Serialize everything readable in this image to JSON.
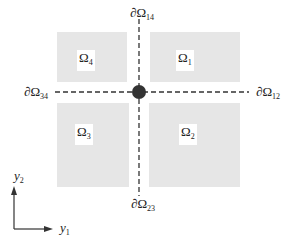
{
  "diagram": {
    "regions": [
      {
        "id": "omega4",
        "symbol": "Ω",
        "sub": "4"
      },
      {
        "id": "omega1",
        "symbol": "Ω",
        "sub": "1"
      },
      {
        "id": "omega3",
        "symbol": "Ω",
        "sub": "3"
      },
      {
        "id": "omega2",
        "symbol": "Ω",
        "sub": "2"
      }
    ],
    "boundaries": {
      "top": {
        "symbol": "∂Ω",
        "sub": "14"
      },
      "left": {
        "symbol": "∂Ω",
        "sub": "34"
      },
      "right": {
        "symbol": "∂Ω",
        "sub": "12"
      },
      "bottom": {
        "symbol": "∂Ω",
        "sub": "23"
      }
    },
    "axes": {
      "x": {
        "symbol": "y",
        "sub": "1"
      },
      "y": {
        "symbol": "y",
        "sub": "2"
      }
    },
    "colors": {
      "region_fill": "#e6e6e6",
      "line": "#333333",
      "junction_point": "#333333"
    }
  }
}
